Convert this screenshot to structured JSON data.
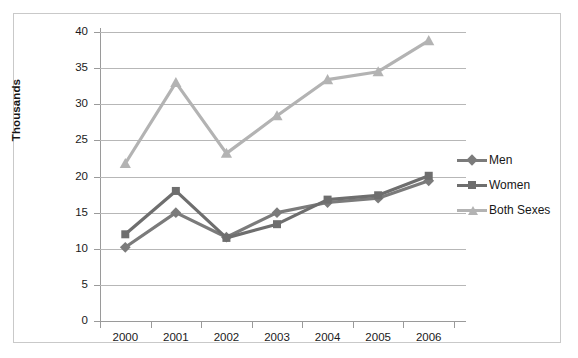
{
  "chart_data": {
    "type": "line",
    "title": "",
    "xlabel": "",
    "ylabel": "Thousands",
    "categories": [
      "2000",
      "2001",
      "2002",
      "2003",
      "2004",
      "2005",
      "2006"
    ],
    "x": [
      2000,
      2001,
      2002,
      2003,
      2004,
      2005,
      2006
    ],
    "ylim": [
      0,
      40
    ],
    "yticks": [
      0,
      5,
      10,
      15,
      20,
      25,
      30,
      35,
      40
    ],
    "ytick_labels": [
      "0",
      "5",
      "10",
      "15",
      "20",
      "25",
      "30",
      "35",
      "40"
    ],
    "grid": "horizontal",
    "legend_position": "right",
    "series": [
      {
        "name": "Men",
        "marker": "diamond",
        "color": "#7b7b7b",
        "values": [
          10.2,
          15.0,
          11.6,
          15.0,
          16.4,
          17.0,
          19.4
        ]
      },
      {
        "name": "Women",
        "marker": "square",
        "color": "#6e6e6e",
        "values": [
          12.0,
          18.0,
          11.5,
          13.4,
          16.8,
          17.4,
          20.1
        ]
      },
      {
        "name": "Both Sexes",
        "marker": "triangle",
        "color": "#b3b3b3",
        "values": [
          21.8,
          33.0,
          23.2,
          28.4,
          33.4,
          34.5,
          38.8
        ]
      }
    ]
  },
  "axis": {
    "y_title": "Thousands"
  },
  "legend": {
    "items": [
      {
        "label": "Men",
        "marker": "diamond",
        "color": "#7b7b7b"
      },
      {
        "label": "Women",
        "marker": "square",
        "color": "#6e6e6e"
      },
      {
        "label": "Both Sexes",
        "marker": "triangle",
        "color": "#b3b3b3"
      }
    ]
  },
  "colors": {
    "grid": "#b7b7b7",
    "axis": "#9a9a9a",
    "frame": "#c9c9c9",
    "background": "#ffffff",
    "men": "#7b7b7b",
    "women": "#6e6e6e",
    "both_sexes": "#b3b3b3"
  }
}
